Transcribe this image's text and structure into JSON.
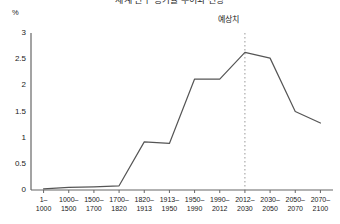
{
  "chart_data": {
    "type": "line",
    "title": "세계 인구 증가율 추이와 전망",
    "unit_label": "%",
    "xlabel": "",
    "ylabel": "",
    "ylim": [
      0,
      3
    ],
    "yticks": [
      3,
      2.5,
      2,
      1.5,
      1,
      0.5,
      0
    ],
    "ytick_labels": [
      "3",
      "2.5",
      "2",
      "1.5",
      "1",
      "0.5",
      "0"
    ],
    "grid": false,
    "legend": null,
    "categories": [
      "1–\n1000",
      "1000–\n1500",
      "1500–\n1700",
      "1700–\n1820",
      "1820–\n1913",
      "1913–\n1950",
      "1950–\n1990",
      "1990–\n2012",
      "2012–\n2030",
      "2030–\n2050",
      "2050–\n2070",
      "2070–\n2100"
    ],
    "values": [
      0.02,
      0.05,
      0.06,
      0.08,
      0.92,
      0.89,
      2.12,
      2.12,
      2.63,
      2.52,
      1.5,
      1.28
    ],
    "annotations": [
      {
        "label": "예상치",
        "type": "vertical-dotted-divider",
        "at_category": "2012–\n2030",
        "index": 8
      }
    ],
    "colors": {
      "line": "#555555",
      "axis": "#666666",
      "divider": "#999999",
      "text": "#1a1a1a",
      "background": "#ffffff"
    }
  }
}
